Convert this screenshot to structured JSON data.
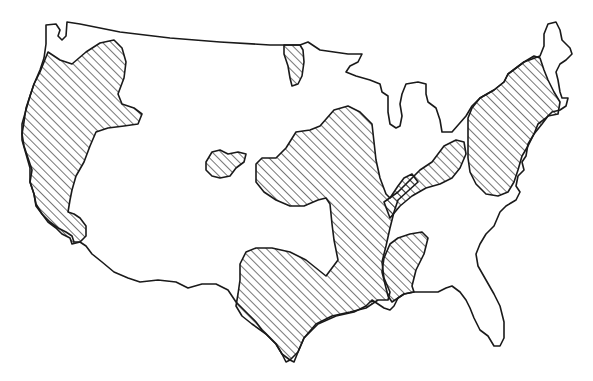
{
  "map": {
    "subject": "United States (contiguous) outline map",
    "style": "black line drawing on white background",
    "background_color": "#ffffff",
    "line_color": "#1a1a1a",
    "legend": null,
    "title": null,
    "shaded_regions": [
      {
        "id": "pacific-coast",
        "description": "West coast from Washington through California"
      },
      {
        "id": "northern-plains",
        "description": "Small area near North Dakota/Montana border"
      },
      {
        "id": "colorado-spot",
        "description": "Small island region in central Rockies"
      },
      {
        "id": "central-plains",
        "description": "Kansas/Nebraska/Missouri/Iowa region extending south through Texas"
      },
      {
        "id": "ohio-valley",
        "description": "Diagonal band through Ohio valley to Pennsylvania"
      },
      {
        "id": "lower-mississippi",
        "description": "Mississippi/Alabama region to gulf coast"
      },
      {
        "id": "northeast",
        "description": "New England and Mid-Atlantic"
      }
    ],
    "fill_pattern": "diagonal hatching"
  }
}
